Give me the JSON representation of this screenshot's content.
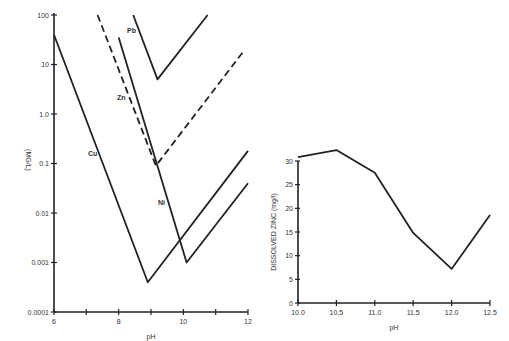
{
  "chart_data": [
    {
      "type": "line",
      "title": "",
      "xlabel": "pH",
      "ylabel": "(MG/L)",
      "yscale": "log",
      "xlim": [
        6,
        12
      ],
      "ylim": [
        0.0001,
        100
      ],
      "x_ticks": [
        "6",
        "",
        "8",
        "",
        "10",
        "",
        "12"
      ],
      "x_tick_values": [
        6,
        7,
        8,
        9,
        10,
        11,
        12
      ],
      "y_ticks": [
        "0.0001",
        "0.001",
        "0.01",
        "0.1",
        "1.0",
        "10",
        "100"
      ],
      "y_tick_values": [
        0.0001,
        0.001,
        0.01,
        0.1,
        1,
        10,
        100
      ],
      "grid": false,
      "series": [
        {
          "name": "Cu",
          "style": "solid",
          "points": [
            [
              6.0,
              40
            ],
            [
              8.9,
              0.0004
            ],
            [
              12.0,
              0.18
            ]
          ]
        },
        {
          "name": "Ni",
          "style": "solid",
          "points": [
            [
              8.0,
              35
            ],
            [
              10.1,
              0.001
            ],
            [
              12.0,
              0.04
            ]
          ]
        },
        {
          "name": "Zn",
          "style": "dashed",
          "points": [
            [
              7.35,
              100
            ],
            [
              9.15,
              0.09
            ],
            [
              11.9,
              20
            ]
          ]
        },
        {
          "name": "Pb",
          "style": "solid",
          "points": [
            [
              8.45,
              100
            ],
            [
              9.2,
              5
            ],
            [
              10.75,
              100
            ]
          ]
        }
      ]
    },
    {
      "type": "line",
      "title": "",
      "xlabel": "pH",
      "ylabel": "DISSOLVED ZINC (mg/l)",
      "xlim": [
        10.0,
        12.5
      ],
      "ylim": [
        0,
        30
      ],
      "x_ticks": [
        "10.0",
        "10.5",
        "11.0",
        "11.5",
        "12.0",
        "12.5"
      ],
      "x_tick_values": [
        10.0,
        10.5,
        11.0,
        11.5,
        12.0,
        12.5
      ],
      "y_ticks": [
        "0",
        "5",
        "10",
        "15",
        "20",
        "25",
        "30"
      ],
      "y_tick_values": [
        0,
        5,
        10,
        15,
        20,
        25,
        30
      ],
      "grid": false,
      "series": [
        {
          "name": "Dissolved Zinc",
          "x": [
            10.0,
            10.5,
            11.0,
            11.5,
            12.0,
            12.5
          ],
          "values": [
            30.8,
            32.3,
            27.5,
            14.8,
            7.2,
            18.6
          ]
        }
      ]
    }
  ]
}
